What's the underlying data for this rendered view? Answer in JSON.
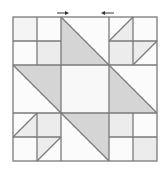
{
  "diagram": {
    "grid": {
      "origin_x": 13,
      "origin_y": 17,
      "cell": 24,
      "cells": 6
    },
    "colors": {
      "background": "#ffffff",
      "line": "#7a7a7a",
      "dark_fill": "#d5d5d5",
      "light_fill": "#ececec",
      "center_fill": "#f8f8f8",
      "white_fill": "#fbfbfb",
      "arrow": "#333333"
    },
    "arrows": [
      {
        "name": "arrow-right",
        "direction": "right",
        "x1": 57,
        "x2": 68,
        "y": 13
      },
      {
        "name": "arrow-left",
        "direction": "left",
        "x1": 114,
        "x2": 102,
        "y": 13
      }
    ],
    "units": [
      {
        "name": "unit-top-left",
        "type": "four-patch"
      },
      {
        "name": "unit-top-center",
        "type": "half-square-triangle"
      },
      {
        "name": "unit-top-right",
        "type": "four-patch-with-triangles"
      },
      {
        "name": "unit-middle-left",
        "type": "half-square-triangle"
      },
      {
        "name": "unit-center",
        "type": "plain-square"
      },
      {
        "name": "unit-middle-right",
        "type": "half-square-triangle"
      },
      {
        "name": "unit-bottom-left",
        "type": "four-patch-with-triangles"
      },
      {
        "name": "unit-bottom-center",
        "type": "half-square-triangle"
      },
      {
        "name": "unit-bottom-right",
        "type": "four-patch"
      }
    ]
  }
}
